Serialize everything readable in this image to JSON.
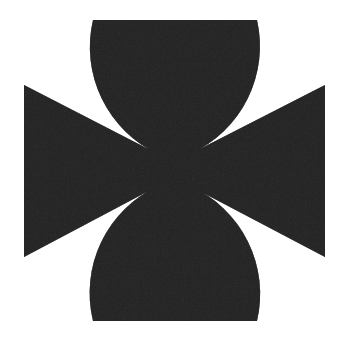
{
  "image": {
    "kind": "symbol-graphic",
    "subject": "cross-pattee",
    "alt_text": "Cross pattée (Maltese / Iron Cross style) symbol",
    "caption": "",
    "width_px": 346,
    "height_px": 349,
    "background_color": "#ffffff",
    "foreground_color": "#2b2b2b",
    "edge_color": "#1d1d1d",
    "texture": "grainy-scanned",
    "symmetry": "four-fold",
    "stroke": "none"
  },
  "geometry": {
    "center_x": 174,
    "center_y": 170,
    "top_edge_y": 20,
    "bottom_edge_y": 321,
    "left_edge_x": 24,
    "right_edge_x": 325,
    "top_arm_left_x": 93,
    "top_arm_right_x": 257,
    "bottom_arm_left_x": 93,
    "bottom_arm_right_x": 257,
    "left_arm_top_y": 85,
    "left_arm_bottom_y": 257,
    "right_arm_top_y": 85,
    "right_arm_bottom_y": 257,
    "waist_width_px": 32,
    "waist_height_px": 32,
    "arc_radius_px": 118
  },
  "labels": {
    "title": "",
    "footer": ""
  }
}
